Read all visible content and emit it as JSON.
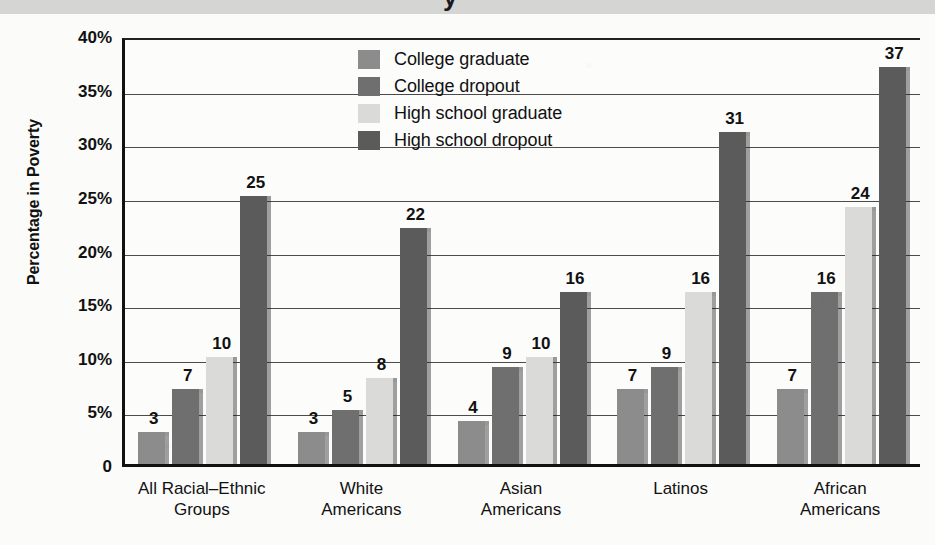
{
  "title_band": {
    "glyph": "y"
  },
  "axes": {
    "ylabel": "Percentage in Poverty",
    "yticks": [
      "0",
      "5%",
      "10%",
      "15%",
      "20%",
      "25%",
      "30%",
      "35%",
      "40%"
    ]
  },
  "legend": {
    "items": [
      {
        "label": "College graduate",
        "color": "#8c8c8c"
      },
      {
        "label": "College dropout",
        "color": "#6f6f6f"
      },
      {
        "label": "High school graduate",
        "color": "#dadad8"
      },
      {
        "label": "High school dropout",
        "color": "#5b5b5b"
      }
    ]
  },
  "chart_data": {
    "type": "bar",
    "title": "",
    "xlabel": "",
    "ylabel": "Percentage in Poverty",
    "ylim": [
      0,
      40
    ],
    "ytick_values": [
      0,
      5,
      10,
      15,
      20,
      25,
      30,
      35,
      40
    ],
    "grid": true,
    "legend_position": "inside-top-center",
    "value_labels": true,
    "categories": [
      "All Racial–Ethnic\nGroups",
      "White\nAmericans",
      "Asian\nAmericans",
      "Latinos",
      "African\nAmericans"
    ],
    "series": [
      {
        "name": "College graduate",
        "color": "#8c8c8c",
        "values": [
          3,
          3,
          4,
          7,
          7
        ]
      },
      {
        "name": "College dropout",
        "color": "#6f6f6f",
        "values": [
          7,
          5,
          9,
          9,
          16
        ]
      },
      {
        "name": "High school graduate",
        "color": "#dadad8",
        "values": [
          10,
          8,
          10,
          16,
          24
        ]
      },
      {
        "name": "High school dropout",
        "color": "#5b5b5b",
        "values": [
          25,
          22,
          16,
          31,
          37
        ]
      }
    ]
  }
}
